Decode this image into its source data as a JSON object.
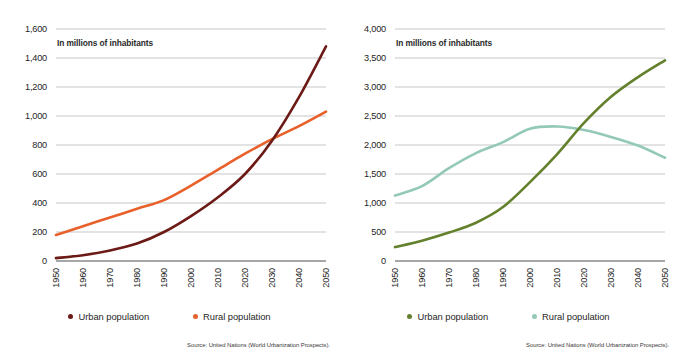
{
  "figure": {
    "background": "#ffffff",
    "panels": [
      "left",
      "right"
    ]
  },
  "common": {
    "axis_note": "In millions of inhabitants",
    "source": "Source: United Nations (World Urbanization Prospects).",
    "legend": {
      "urban_label": "Urban population",
      "rural_label": "Rural population"
    },
    "xtick_labels": [
      "1950",
      "1960",
      "1970",
      "1980",
      "1990",
      "2000",
      "2010",
      "2020",
      "2030",
      "2040",
      "2050"
    ]
  },
  "colors": {
    "left_urban": "#6B1A16",
    "left_rural": "#E8602A",
    "right_urban": "#63802C",
    "right_rural": "#93C9B6",
    "gridline": "#b9b9b9",
    "axisline": "#8a8a8a",
    "tick_text": "#252525"
  },
  "chart_data": [
    {
      "id": "left",
      "type": "line",
      "title": "",
      "xlabel": "",
      "ylabel": "In millions of inhabitants",
      "xlim": [
        1950,
        2050
      ],
      "ylim": [
        0,
        1600
      ],
      "grid": true,
      "legend_position": "bottom",
      "ytick_labels": [
        "0",
        "200",
        "400",
        "600",
        "800",
        "1,000",
        "1,200",
        "1,400",
        "1,600"
      ],
      "ytick_values": [
        0,
        200,
        400,
        600,
        800,
        1000,
        1200,
        1400,
        1600
      ],
      "x": [
        1950,
        1960,
        1970,
        1980,
        1990,
        2000,
        2010,
        2020,
        2030,
        2040,
        2050
      ],
      "series": [
        {
          "name": "Urban population",
          "color": "#6B1A16",
          "values": [
            20,
            40,
            72,
            120,
            200,
            310,
            440,
            600,
            830,
            1130,
            1480
          ]
        },
        {
          "name": "Rural population",
          "color": "#E8602A",
          "values": [
            180,
            240,
            300,
            360,
            420,
            520,
            630,
            740,
            840,
            930,
            1030
          ]
        }
      ]
    },
    {
      "id": "right",
      "type": "line",
      "title": "",
      "xlabel": "",
      "ylabel": "In millions of inhabitants",
      "xlim": [
        1950,
        2050
      ],
      "ylim": [
        0,
        4000
      ],
      "grid": true,
      "legend_position": "bottom",
      "ytick_labels": [
        "0",
        "500",
        "1,000",
        "1,500",
        "2,000",
        "2,500",
        "3,000",
        "3,500",
        "4,000"
      ],
      "ytick_values": [
        0,
        500,
        1000,
        1500,
        2000,
        2500,
        3000,
        3500,
        4000
      ],
      "x": [
        1950,
        1960,
        1970,
        1980,
        1990,
        2000,
        2010,
        2020,
        2030,
        2040,
        2050
      ],
      "series": [
        {
          "name": "Urban population",
          "color": "#63802C",
          "values": [
            240,
            350,
            490,
            660,
            930,
            1360,
            1840,
            2380,
            2830,
            3170,
            3460
          ]
        },
        {
          "name": "Rural population",
          "color": "#93C9B6",
          "values": [
            1130,
            1290,
            1600,
            1860,
            2050,
            2280,
            2320,
            2260,
            2140,
            1990,
            1780
          ]
        }
      ]
    }
  ]
}
